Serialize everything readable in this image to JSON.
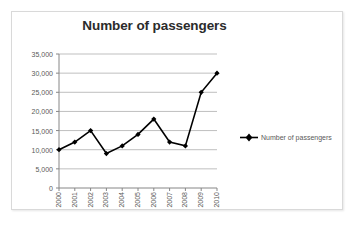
{
  "chart_data": {
    "type": "line",
    "title": "Number of passengers",
    "xlabel": "",
    "ylabel": "",
    "categories": [
      "2000",
      "2001",
      "2002",
      "2003",
      "2004",
      "2005",
      "2006",
      "2007",
      "2008",
      "2009",
      "2010"
    ],
    "series": [
      {
        "name": "Number of passengers",
        "values": [
          10000,
          12000,
          15000,
          9000,
          11000,
          14000,
          18000,
          12000,
          11000,
          25000,
          30000
        ],
        "color": "#000000",
        "marker": "diamond"
      }
    ],
    "ylim": [
      0,
      35000
    ],
    "y_ticks": [
      0,
      5000,
      10000,
      15000,
      20000,
      25000,
      30000,
      35000
    ],
    "y_tick_labels": [
      "0",
      "5,000",
      "10,000",
      "15,000",
      "20,000",
      "25,000",
      "30,000",
      "35,000"
    ],
    "grid": true,
    "grid_axis": "y",
    "grid_color": "#bfbfbf",
    "legend_position": "right",
    "legend_entries": [
      "Number of passengers"
    ],
    "axis_color": "#868686",
    "background": "#ffffff",
    "border_color": "#d9d9d9"
  },
  "legend": {
    "label": "Number of passengers",
    "marker_icon": "line-diamond-marker-icon"
  }
}
